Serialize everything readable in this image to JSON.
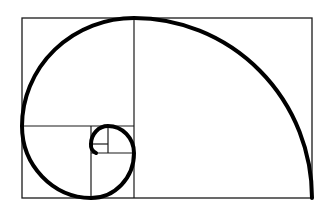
{
  "diagram": {
    "type": "golden-spiral",
    "background": "#ffffff",
    "line_color": "#1a1a1a",
    "spiral_color": "#000000",
    "outer_rect": {
      "x": 22,
      "y": 18,
      "w": 290,
      "h": 180
    },
    "dividers": [
      {
        "x1": 134,
        "y1": 18,
        "x2": 134,
        "y2": 198
      },
      {
        "x1": 22,
        "y1": 126,
        "x2": 134,
        "y2": 126
      },
      {
        "x1": 91,
        "y1": 126,
        "x2": 91,
        "y2": 198
      },
      {
        "x1": 91,
        "y1": 153,
        "x2": 134,
        "y2": 153
      },
      {
        "x1": 108,
        "y1": 126,
        "x2": 108,
        "y2": 153
      },
      {
        "x1": 91,
        "y1": 144,
        "x2": 108,
        "y2": 144
      }
    ]
  }
}
